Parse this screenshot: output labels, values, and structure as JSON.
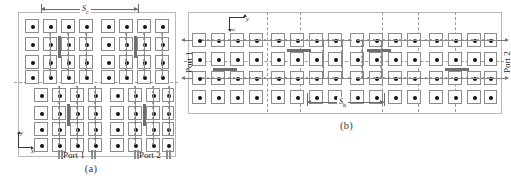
{
  "figure": {
    "panels": [
      {
        "id": "a",
        "caption": "(a)",
        "view": "top view",
        "dimension": {
          "label": "S",
          "sub": "c"
        },
        "ports": [
          {
            "name": "Port 1"
          },
          {
            "name": "Port 2"
          }
        ],
        "axes": {
          "x": "x",
          "y": "y"
        },
        "array": {
          "rows": 8,
          "cols": 8,
          "subarrays": 2
        }
      },
      {
        "id": "b",
        "caption": "(b)",
        "view": "unfolded / side view",
        "dimension": {
          "label": "S",
          "sub": "h"
        },
        "ports": [
          {
            "name": "Port 1"
          },
          {
            "name": "Port 2"
          }
        ],
        "axes": {
          "x": "x",
          "y": "y"
        },
        "array": {
          "rows": 4,
          "cols": 20
        }
      }
    ],
    "colors": {
      "patch_outline": "#8d8d8d",
      "via_dot": "#121212",
      "feed_strip": "#6f6f6f",
      "symmetry_line": "#9a9a9a",
      "dimension_line": "#6b6b6b",
      "panel_border": "#b9b9b9",
      "background": "#ffffff"
    }
  }
}
